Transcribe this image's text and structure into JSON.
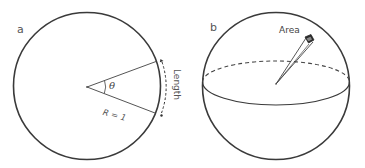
{
  "panels": {
    "a": {
      "label": "a",
      "angle_symbol": "θ",
      "radius_label": "R = 1",
      "arc_label": "Length",
      "shape": "circle"
    },
    "b": {
      "label": "b",
      "solid_angle_label": "Area",
      "shape": "sphere"
    }
  },
  "colors": {
    "outline": "#3a3a3a",
    "lines": "#555555",
    "text": "#444444",
    "background": "#ffffff"
  }
}
